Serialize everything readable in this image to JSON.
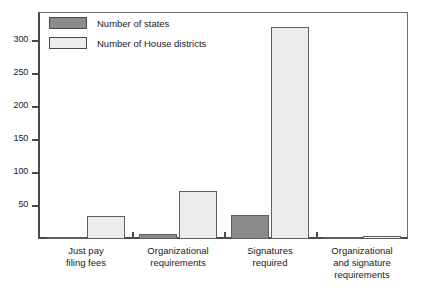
{
  "chart_data": {
    "type": "bar",
    "title": "",
    "xlabel": "",
    "ylabel": "",
    "ylim": [
      0,
      345
    ],
    "yticks": [
      50,
      100,
      150,
      200,
      250,
      300
    ],
    "grid": false,
    "legend_position": "top-left",
    "categories": [
      "Just pay filing fees",
      "Organizational requirements",
      "Signatures required",
      "Organizational and signature requirements"
    ],
    "category_lines": [
      [
        "Just pay",
        "filing fees"
      ],
      [
        "Organizational",
        "requirements"
      ],
      [
        "Signatures",
        "required"
      ],
      [
        "Organizational",
        "and signature",
        "requirements"
      ]
    ],
    "series": [
      {
        "name": "Number of states",
        "color": "#8a8a8a",
        "values": [
          2,
          7,
          36,
          3
        ]
      },
      {
        "name": "Number of House districts",
        "color": "#ececec",
        "values": [
          35,
          73,
          322,
          4
        ]
      }
    ]
  },
  "legend": {
    "items": [
      {
        "label": "Number of states",
        "swatch": "states"
      },
      {
        "label": "Number of House districts",
        "swatch": "districts"
      }
    ]
  },
  "axis": {
    "tick_labels": [
      "300",
      "250",
      "200",
      "150",
      "100",
      "50"
    ]
  }
}
